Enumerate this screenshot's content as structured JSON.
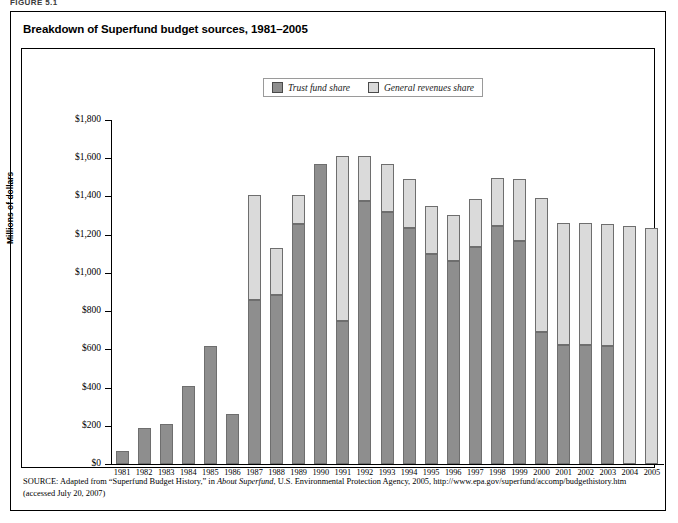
{
  "figure_header": "FIGURE 5.1",
  "title": "Breakdown of Superfund budget sources, 1981–2005",
  "legend": {
    "items": [
      {
        "label": "Trust fund share",
        "color": "#8e8e8e"
      },
      {
        "label": "General revenues share",
        "color": "#dadada"
      }
    ]
  },
  "axis": {
    "ylabel": "Millions of dollars",
    "yticks": [
      "$0",
      "$200",
      "$400",
      "$600",
      "$800",
      "$1,000",
      "$1,200",
      "$1,400",
      "$1,600",
      "$1,800"
    ]
  },
  "source": {
    "keyword": "SOURCE:",
    "text": " Adapted from “Superfund Budget History,” in ",
    "italic1": "About Superfund",
    "text2": ", U.S. Environmental Protection Agency, 2005, http://www.epa.gov/superfund/accomp/budgethistory.htm (accessed July 20, 2007)"
  },
  "chart_data": {
    "type": "bar",
    "stacked": true,
    "title": "Breakdown of Superfund budget sources, 1981–2005",
    "xlabel": "",
    "ylabel": "Millions of dollars",
    "ylim": [
      0,
      1800
    ],
    "ytick_step": 200,
    "grid": false,
    "legend_position": "top-center",
    "categories": [
      "1981",
      "1982",
      "1983",
      "1984",
      "1985",
      "1986",
      "1987",
      "1988",
      "1989",
      "1990",
      "1991",
      "1992",
      "1993",
      "1994",
      "1995",
      "1996",
      "1997",
      "1998",
      "1999",
      "2000",
      "2001",
      "2002",
      "2003",
      "2004",
      "2005"
    ],
    "series": [
      {
        "name": "Trust fund share",
        "color": "#8e8e8e",
        "values": [
          70,
          190,
          210,
          410,
          620,
          260,
          860,
          885,
          1255,
          1570,
          750,
          1375,
          1320,
          1235,
          1100,
          1060,
          1135,
          1245,
          1165,
          690,
          625,
          625,
          620,
          0,
          0
        ]
      },
      {
        "name": "General revenues share",
        "color": "#dadada",
        "values": [
          0,
          0,
          0,
          0,
          0,
          0,
          550,
          245,
          155,
          0,
          860,
          235,
          250,
          255,
          250,
          245,
          250,
          250,
          325,
          700,
          635,
          635,
          635,
          1245,
          1235
        ]
      }
    ],
    "totals": [
      70,
      190,
      210,
      410,
      620,
      260,
      1410,
      1130,
      1410,
      1570,
      1610,
      1610,
      1570,
      1490,
      1350,
      1305,
      1385,
      1495,
      1490,
      1390,
      1260,
      1260,
      1255,
      1245,
      1235
    ]
  }
}
